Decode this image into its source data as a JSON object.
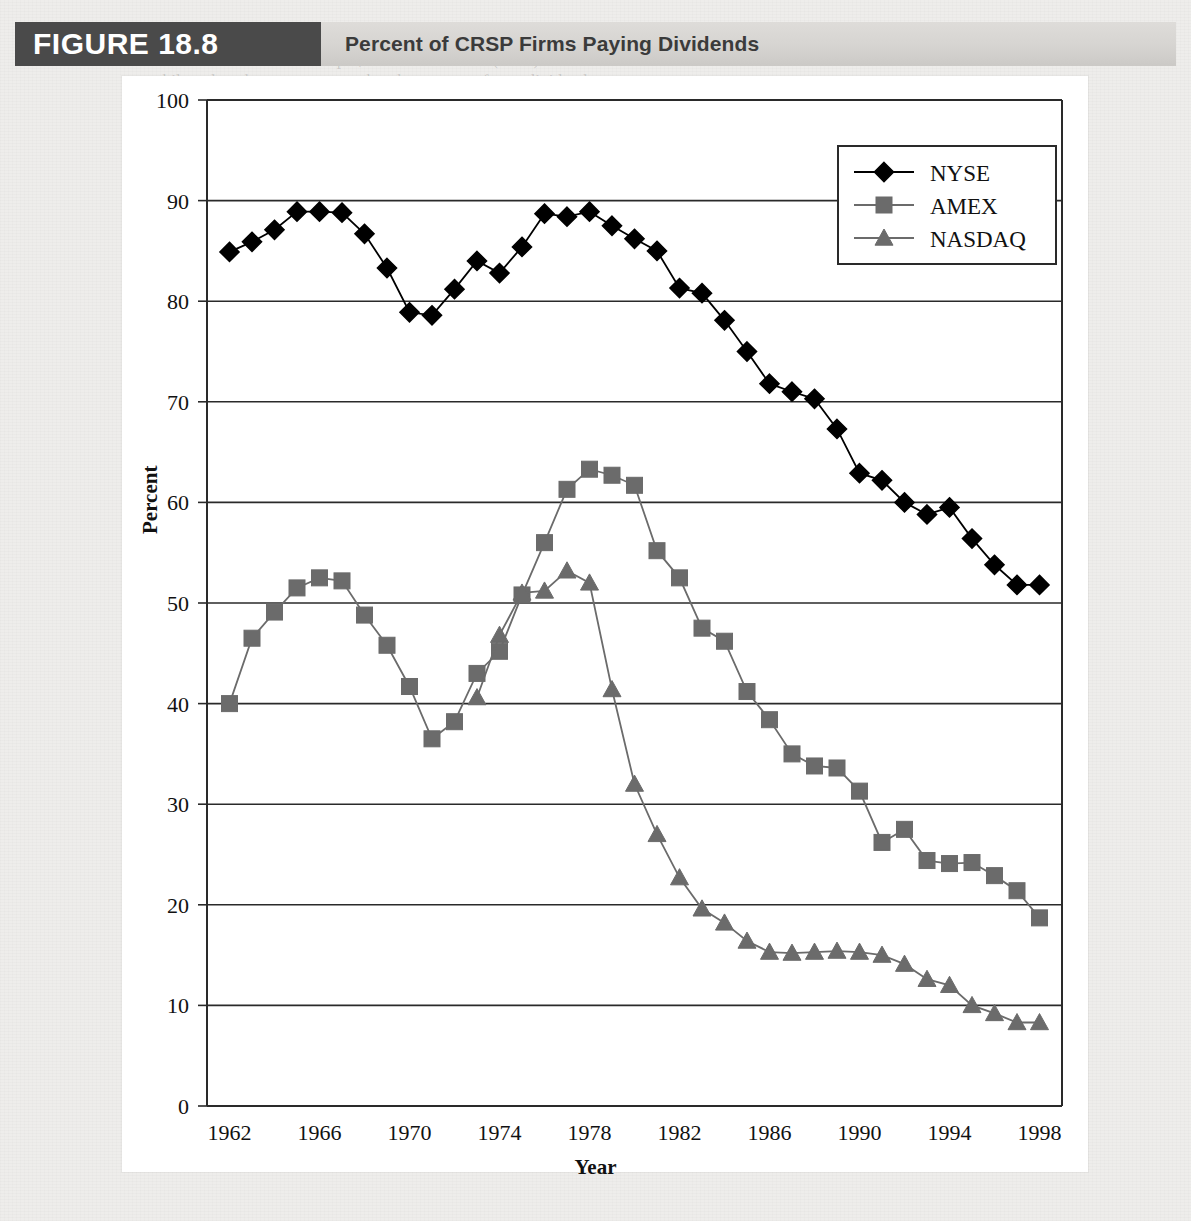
{
  "figure": {
    "tag": "FIGURE 18.8",
    "title": "Percent of CRSP Firms Paying Dividends"
  },
  "background_text": {
    "lines": [
      "pan ality by an explosion in",
      "small firm IPOs. For example, Fama and French (2001) document an",
      "while today, the same percent that the percent of new dividend-",
      "has fallen in recent years."
    ]
  },
  "chart_data": {
    "type": "line",
    "title": "Percent of CRSP Firms Paying Dividends",
    "xlabel": "Year",
    "ylabel": "Percent",
    "xlim": [
      1961,
      1999
    ],
    "ylim": [
      0,
      100
    ],
    "ytick_step": 10,
    "xtick_step": 4,
    "grid": "horizontal",
    "legend_position": "top-right",
    "yticks": [
      "0",
      "10",
      "20",
      "30",
      "40",
      "50",
      "60",
      "70",
      "80",
      "90",
      "100"
    ],
    "xticks": [
      "1962",
      "1966",
      "1970",
      "1974",
      "1978",
      "1982",
      "1986",
      "1990",
      "1994",
      "1998"
    ],
    "x": [
      1962,
      1963,
      1964,
      1965,
      1966,
      1967,
      1968,
      1969,
      1970,
      1971,
      1972,
      1973,
      1974,
      1975,
      1976,
      1977,
      1978,
      1979,
      1980,
      1981,
      1982,
      1983,
      1984,
      1985,
      1986,
      1987,
      1988,
      1989,
      1990,
      1991,
      1992,
      1993,
      1994,
      1995,
      1996,
      1997,
      1998
    ],
    "series": [
      {
        "name": "NYSE",
        "marker": "diamond",
        "color": "#000000",
        "values": [
          84.9,
          85.9,
          87.1,
          88.9,
          88.9,
          88.8,
          86.7,
          83.3,
          78.9,
          78.6,
          81.2,
          84.0,
          82.8,
          85.4,
          88.7,
          88.4,
          88.9,
          87.5,
          86.2,
          85.0,
          81.3,
          80.8,
          78.1,
          75.0,
          71.8,
          71.0,
          70.3,
          67.3,
          62.9,
          62.2,
          60.0,
          58.8,
          59.5,
          56.4,
          53.8,
          51.8,
          51.8
        ]
      },
      {
        "name": "AMEX",
        "marker": "square",
        "color": "#6b6b6b",
        "values": [
          40.0,
          46.5,
          49.1,
          51.5,
          52.5,
          52.2,
          48.8,
          45.8,
          41.7,
          36.5,
          38.2,
          43.0,
          45.2,
          50.8,
          56.0,
          61.3,
          63.3,
          62.7,
          61.7,
          55.2,
          52.5,
          47.5,
          46.2,
          41.2,
          38.4,
          35.0,
          33.8,
          33.6,
          31.3,
          26.2,
          27.5,
          24.4,
          24.1,
          24.2,
          22.9,
          21.4,
          18.7
        ]
      },
      {
        "name": "NASDAQ",
        "marker": "triangle",
        "color": "#6b6b6b",
        "values": [
          null,
          null,
          null,
          null,
          null,
          null,
          null,
          null,
          null,
          null,
          null,
          40.6,
          46.8,
          51.0,
          51.2,
          53.2,
          52.0,
          41.4,
          32.0,
          27.0,
          22.7,
          19.6,
          18.2,
          16.4,
          15.3,
          15.2,
          15.3,
          15.4,
          15.3,
          15.0,
          14.1,
          12.6,
          12.0,
          10.0,
          9.2,
          8.3,
          8.3
        ]
      }
    ]
  },
  "legend": {
    "items": [
      {
        "label": "NYSE",
        "marker": "diamond",
        "color": "#000000"
      },
      {
        "label": "AMEX",
        "marker": "square",
        "color": "#6b6b6b"
      },
      {
        "label": "NASDAQ",
        "marker": "triangle",
        "color": "#6b6b6b"
      }
    ]
  }
}
